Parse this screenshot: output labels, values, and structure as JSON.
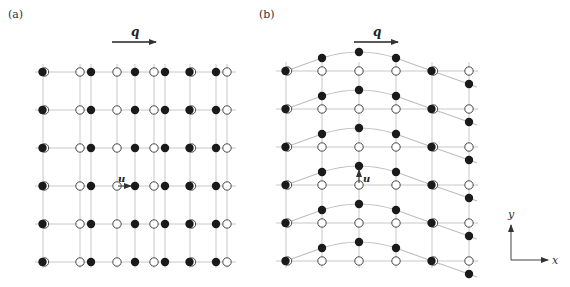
{
  "panels": [
    {
      "label": "(a)",
      "wave_vector_label": "q",
      "displacement_label": "u",
      "description": "Longitudinal displacement: atoms displaced along x, parallel to q",
      "columns_x": [
        43,
        80,
        91,
        117,
        135,
        154,
        165,
        190,
        216,
        227
      ],
      "atoms_row": [
        {
          "x": 43,
          "type": "both"
        },
        {
          "x": 80,
          "type": "open"
        },
        {
          "x": 91,
          "type": "filled"
        },
        {
          "x": 117,
          "type": "open"
        },
        {
          "x": 135,
          "type": "filled"
        },
        {
          "x": 154,
          "type": "open"
        },
        {
          "x": 165,
          "type": "filled"
        },
        {
          "x": 190,
          "type": "both"
        },
        {
          "x": 216,
          "type": "filled"
        },
        {
          "x": 227,
          "type": "open"
        }
      ],
      "rows_y": [
        72,
        110,
        148,
        186,
        224,
        262
      ]
    },
    {
      "label": "(b)",
      "wave_vector_label": "q",
      "displacement_label": "u",
      "description": "Transverse displacement: atoms displaced along y, perpendicular to q",
      "columns_x": [
        286,
        322,
        359,
        396,
        432,
        469
      ],
      "displacements_y": [
        0,
        -13,
        -19,
        -13,
        0,
        13
      ],
      "rows_y": [
        71,
        109,
        147,
        185,
        223,
        261
      ]
    }
  ],
  "axes": {
    "x_label": "x",
    "y_label": "y"
  },
  "colors": {
    "grid": "#c8c8c8",
    "atom": "#1a1a1a",
    "arrow": "#333333"
  }
}
